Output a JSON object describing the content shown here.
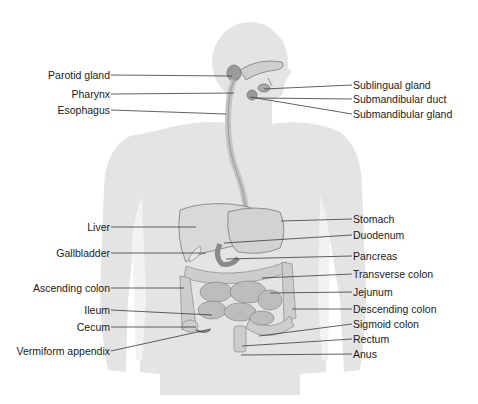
{
  "figure": {
    "colors": {
      "silhouette": "#e3e3e3",
      "organ_fill": "#d6d6d6",
      "organ_stroke": "#8a8a8a",
      "leader_line": "#3a3a3a",
      "text": "#1a1a1a"
    }
  },
  "labels_left": [
    {
      "id": "parotid-gland",
      "text": "Parotid gland",
      "y": 75,
      "line_to": [
        232,
        76
      ]
    },
    {
      "id": "pharynx",
      "text": "Pharynx",
      "y": 94,
      "line_to": [
        234,
        93
      ]
    },
    {
      "id": "esophagus",
      "text": "Esophagus",
      "y": 110,
      "line_to": [
        226,
        114
      ]
    },
    {
      "id": "liver",
      "text": "Liver",
      "y": 227,
      "line_to": [
        196,
        227
      ]
    },
    {
      "id": "gallbladder",
      "text": "Gallbladder",
      "y": 253,
      "line_to": [
        206,
        253
      ]
    },
    {
      "id": "ascending-colon",
      "text": "Ascending colon",
      "y": 288,
      "line_to": [
        184,
        288
      ]
    },
    {
      "id": "ileum",
      "text": "Ileum",
      "y": 310,
      "line_to": [
        212,
        315
      ]
    },
    {
      "id": "cecum",
      "text": "Cecum",
      "y": 327,
      "line_to": [
        196,
        327
      ]
    },
    {
      "id": "vermiform-appendix",
      "text": "Vermiform appendix",
      "y": 351,
      "line_to": [
        211,
        329
      ]
    }
  ],
  "labels_right": [
    {
      "id": "sublingual-gland",
      "text": "Sublingual gland",
      "y": 85,
      "line_from": [
        264,
        89
      ]
    },
    {
      "id": "submandibular-duct",
      "text": "Submandibular duct",
      "y": 99,
      "line_from": [
        256,
        98
      ]
    },
    {
      "id": "submandibular-gland",
      "text": "Submandibular gland",
      "y": 114,
      "line_from": [
        250,
        97
      ]
    },
    {
      "id": "stomach",
      "text": "Stomach",
      "y": 219,
      "line_from": [
        281,
        221
      ]
    },
    {
      "id": "duodenum",
      "text": "Duodenum",
      "y": 235,
      "line_from": [
        224,
        243
      ]
    },
    {
      "id": "pancreas",
      "text": "Pancreas",
      "y": 256,
      "line_from": [
        226,
        259
      ]
    },
    {
      "id": "transverse-colon",
      "text": "Transverse colon",
      "y": 274,
      "line_from": [
        262,
        278
      ]
    },
    {
      "id": "jejunum",
      "text": "Jejunum",
      "y": 292,
      "line_from": [
        270,
        293
      ]
    },
    {
      "id": "descending-colon",
      "text": "Descending colon",
      "y": 309,
      "line_from": [
        292,
        309
      ]
    },
    {
      "id": "sigmoid-colon",
      "text": "Sigmoid colon",
      "y": 324,
      "line_from": [
        259,
        336
      ]
    },
    {
      "id": "rectum",
      "text": "Rectum",
      "y": 339,
      "line_from": [
        242,
        346
      ]
    },
    {
      "id": "anus",
      "text": "Anus",
      "y": 354,
      "line_from": [
        241,
        355
      ]
    }
  ],
  "layout": {
    "left_label_right_edge": 110,
    "right_label_left_edge": 353
  }
}
